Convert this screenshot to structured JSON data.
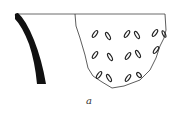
{
  "figure": {
    "label": "a",
    "colors": {
      "line": "#222222",
      "fill": "#111111",
      "background": "#ffffff"
    }
  }
}
